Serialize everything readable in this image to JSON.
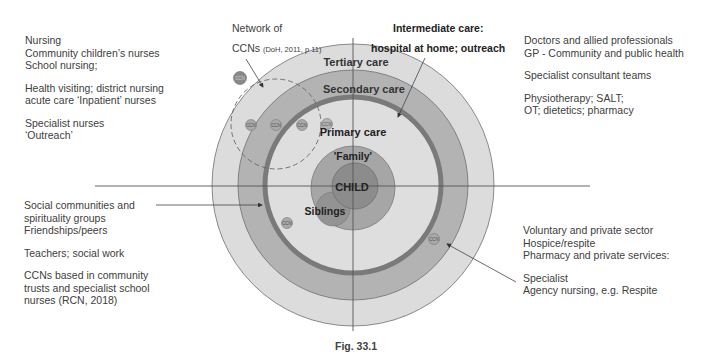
{
  "figure": {
    "caption": "Fig. 33.1",
    "colors": {
      "background": "#ffffff",
      "tertiary_ring": "#dcdcdc",
      "secondary_ring": "#b3b3b3",
      "primary_area": "#dedede",
      "primary_boundary": "#7a7a7a",
      "family_circle": "#a6a6a6",
      "child_circle": "#8c8c8c",
      "siblings_circle": "#939393",
      "axis_line": "#555555",
      "text": "#404040"
    },
    "rings": {
      "tertiary": "Tertiary care",
      "secondary": "Secondary care",
      "primary": "Primary care",
      "family": "'Family'",
      "child": "CHILD",
      "siblings": "Siblings"
    },
    "ccn_marker_label": "CCN",
    "network_label": {
      "line1": "Network of",
      "line2_main": "CCNs",
      "line2_ref": "(DoH, 2011, p 11)"
    },
    "intermediate_label": {
      "line1": "Intermediate care:",
      "line2": "hospital at home; outreach"
    }
  },
  "left_top_block": {
    "lines": [
      "Nursing",
      "Community children’s nurses",
      "School nursing;",
      "",
      "Health visiting; district nursing",
      "acute care ‘Inpatient’ nurses",
      "",
      "Specialist nurses",
      "‘Outreach’"
    ]
  },
  "left_bottom_block": {
    "lines": [
      "Social communities and",
      "spirituality groups",
      "Friendships/peers",
      "",
      "Teachers; social work",
      "",
      "CCNs based in community",
      "trusts and specialist school",
      "nurses (RCN, 2018)"
    ]
  },
  "right_top_block": {
    "lines": [
      "Doctors and allied professionals",
      "GP - Community and public health",
      "",
      "Specialist consultant teams",
      "",
      "Physiotherapy; SALT;",
      "OT; dietetics; pharmacy"
    ]
  },
  "right_bottom_block": {
    "lines": [
      "Voluntary and private sector",
      "Hospice/respite",
      "Pharmacy and private services:",
      "",
      "Specialist",
      "Agency nursing, e.g. Respite"
    ]
  }
}
